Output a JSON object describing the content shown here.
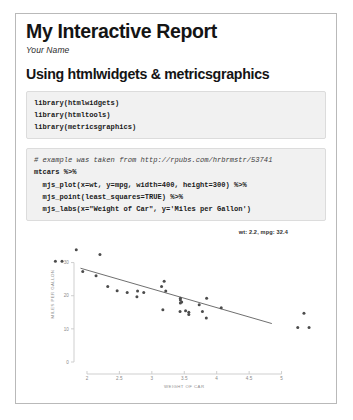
{
  "document": {
    "title": "My Interactive Report",
    "author": "Your Name",
    "section_heading": "Using htmlwidgets & metricsgraphics"
  },
  "code_blocks": [
    {
      "name": "library-imports",
      "lines": [
        "library(htmlwidgets)",
        "library(htmltools)",
        "library(metricsgraphics)"
      ]
    },
    {
      "name": "plot-code",
      "comment": "# example was taken from http://rpubs.com/hrbrmstr/53741",
      "lines": [
        "mtcars %>%",
        "  mjs_plot(x=wt, y=mpg, width=400, height=300) %>%",
        "  mjs_point(least_squares=TRUE) %>%",
        "  mjs_labs(x=\"Weight of Car\", y='Miles per Gallon')"
      ]
    }
  ],
  "chart_data": {
    "type": "scatter",
    "title": "",
    "tooltip": "wt: 2.2, mpg: 32.4",
    "xlabel": "WEIGHT OF CAR",
    "ylabel": "MILES PER GALLON",
    "xlim": [
      1.8,
      5.5
    ],
    "ylim": [
      0,
      35
    ],
    "xticks": [
      2,
      2.5,
      3,
      3.5,
      4,
      4.5,
      5
    ],
    "xticklabels": [
      "2",
      "2.5",
      "3",
      "3.5",
      "4",
      "4.5",
      "5"
    ],
    "yticks": [
      0,
      10,
      20,
      30
    ],
    "yticklabels": [
      "0",
      "10",
      "20",
      "30"
    ],
    "grid": false,
    "legend": "none",
    "series": [
      {
        "name": "mtcars",
        "x": [
          2.62,
          2.875,
          2.32,
          3.215,
          3.44,
          3.46,
          3.57,
          3.19,
          3.15,
          3.44,
          3.44,
          4.07,
          3.73,
          3.78,
          5.25,
          5.424,
          5.345,
          2.2,
          1.615,
          1.835,
          2.465,
          3.52,
          3.435,
          3.84,
          3.845,
          1.935,
          2.14,
          1.513,
          3.17,
          2.77,
          3.57,
          2.78
        ],
        "y": [
          21.0,
          21.0,
          22.8,
          21.4,
          18.7,
          18.1,
          14.3,
          24.4,
          22.8,
          19.2,
          17.8,
          16.4,
          17.3,
          15.2,
          10.4,
          10.4,
          14.7,
          32.4,
          30.4,
          33.9,
          21.5,
          15.5,
          15.2,
          13.3,
          19.2,
          27.3,
          26.0,
          30.4,
          15.8,
          19.7,
          15.0,
          21.4
        ]
      }
    ],
    "fit_line": {
      "name": "least-squares",
      "x0": 1.9,
      "y0": 28.3,
      "x1": 4.85,
      "y1": 11.6
    }
  }
}
